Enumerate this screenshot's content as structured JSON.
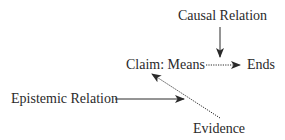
{
  "diagram": {
    "nodes": [
      {
        "id": "causal",
        "label": "Causal Relation"
      },
      {
        "id": "claim",
        "label": "Claim: Means"
      },
      {
        "id": "ends",
        "label": "Ends"
      },
      {
        "id": "epistemic",
        "label": "Epistemic Relation"
      },
      {
        "id": "evidence",
        "label": "Evidence"
      }
    ],
    "edges": [
      {
        "from": "causal",
        "to": "means-ends-link",
        "style": "solid"
      },
      {
        "from": "claim",
        "to": "ends",
        "style": "dotted"
      },
      {
        "from": "epistemic",
        "to": "evidence-claim-link",
        "style": "solid"
      },
      {
        "from": "evidence",
        "to": "claim",
        "style": "dotted"
      }
    ],
    "colors": {
      "line": "#2a2a2a",
      "text": "#2a2a2a",
      "background": "#ffffff"
    }
  }
}
